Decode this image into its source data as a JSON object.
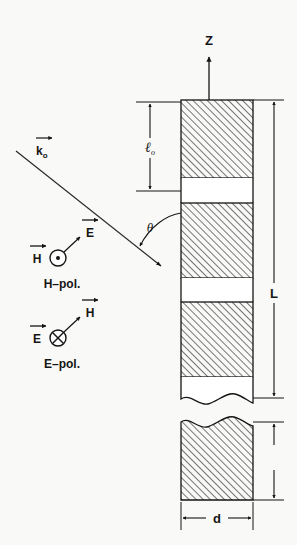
{
  "figure": {
    "type": "physics-schematic",
    "background_color": "#f9f9f7",
    "line_color": "#1a1a1a",
    "hatch_color": "#555555",
    "labels": {
      "z_axis": "Z",
      "wave_vector": "k",
      "wave_vector_sub": "o",
      "period": "ℓ",
      "period_sub": "o",
      "angle": "θ",
      "total_length": "L",
      "thickness": "d",
      "h_field": "H",
      "e_field": "E",
      "h_pol_caption": "H–pol.",
      "e_pol_caption": "E–pol."
    },
    "slab": {
      "left_x": 181,
      "right_x": 253,
      "top_y": 100,
      "blocks": [
        {
          "name": "block-1",
          "top": 100,
          "bottom": 178
        },
        {
          "name": "block-2",
          "top": 203,
          "bottom": 278
        },
        {
          "name": "block-3",
          "top": 302,
          "bottom": 377
        },
        {
          "name": "block-4-broken",
          "top": 422,
          "bottom": 500
        }
      ],
      "gaps": [
        {
          "name": "gap-1",
          "top": 178,
          "bottom": 203
        },
        {
          "name": "gap-2",
          "top": 278,
          "bottom": 302
        }
      ]
    },
    "polarization_symbols": {
      "h_pol_marker": "dot-in-circle",
      "e_pol_marker": "cross-in-circle"
    }
  }
}
